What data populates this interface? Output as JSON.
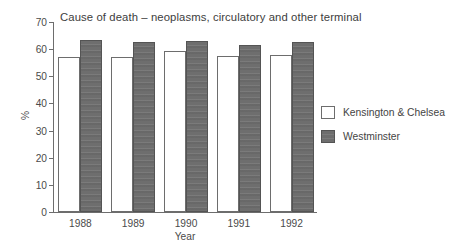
{
  "chart_data": {
    "type": "bar",
    "title": "Cause of death – neoplasms, circulatory and other terminal",
    "xlabel": "Year",
    "ylabel": "%",
    "categories": [
      "1988",
      "1989",
      "1990",
      "1991",
      "1992"
    ],
    "series": [
      {
        "name": "Kensington & Chelsea",
        "values": [
          57.2,
          57.1,
          59.4,
          57.6,
          58.0
        ],
        "color": "#ffffff",
        "edge_color": "#6d6d6d"
      },
      {
        "name": "Westminster",
        "values": [
          63.5,
          62.6,
          62.9,
          61.5,
          62.5
        ],
        "color": "#6e6e6e",
        "edge_color": "#545454"
      }
    ],
    "ylim": [
      0,
      70
    ],
    "yticks": [
      0,
      10,
      20,
      30,
      40,
      50,
      60,
      70
    ],
    "ytick_labels": [
      "0",
      "10",
      "20",
      "30",
      "40",
      "50",
      "60",
      "70"
    ],
    "grid": false,
    "legend_position": "right"
  },
  "legend": {
    "entries": [
      {
        "label": "Kensington & Chelsea",
        "swatch": "white-square-icon"
      },
      {
        "label": "Westminster",
        "swatch": "dark-square-icon"
      }
    ]
  }
}
